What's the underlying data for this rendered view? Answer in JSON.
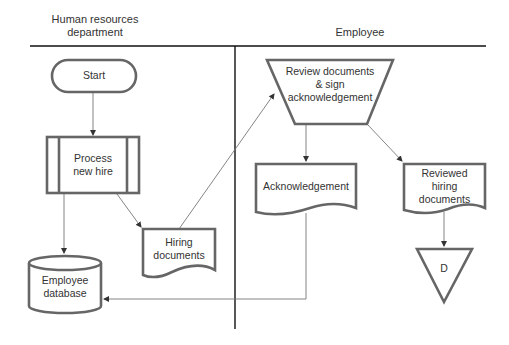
{
  "swimlanes": [
    {
      "id": "hr",
      "title": "Human resources\ndepartment"
    },
    {
      "id": "employee",
      "title": "Employee"
    }
  ],
  "nodes": [
    {
      "id": "start",
      "type": "terminator",
      "lane": "hr",
      "label": "Start"
    },
    {
      "id": "process_new_hire",
      "type": "predefined-process",
      "lane": "hr",
      "label": "Process\nnew hire"
    },
    {
      "id": "hiring_documents",
      "type": "document",
      "lane": "hr",
      "label": "Hiring\ndocuments"
    },
    {
      "id": "employee_database",
      "type": "database",
      "lane": "hr",
      "label": "Employee\ndatabase"
    },
    {
      "id": "review_sign",
      "type": "manual-operation",
      "lane": "employee",
      "label": "Review documents\n& sign\nacknowledgement"
    },
    {
      "id": "acknowledgement",
      "type": "document",
      "lane": "employee",
      "label": "Acknowledgement"
    },
    {
      "id": "reviewed_hiring_documents",
      "type": "document",
      "lane": "employee",
      "label": "Reviewed\nhiring\ndocuments"
    },
    {
      "id": "d",
      "type": "offline-storage",
      "lane": "employee",
      "label": "D"
    }
  ],
  "edges": [
    {
      "from": "start",
      "to": "process_new_hire"
    },
    {
      "from": "process_new_hire",
      "to": "employee_database"
    },
    {
      "from": "process_new_hire",
      "to": "hiring_documents"
    },
    {
      "from": "hiring_documents",
      "to": "review_sign"
    },
    {
      "from": "review_sign",
      "to": "acknowledgement"
    },
    {
      "from": "review_sign",
      "to": "reviewed_hiring_documents"
    },
    {
      "from": "acknowledgement",
      "to": "employee_database"
    },
    {
      "from": "reviewed_hiring_documents",
      "to": "d"
    }
  ],
  "colors": {
    "shape_stroke": "#666666",
    "connector": "#777777",
    "lane_line": "#111111",
    "text": "#333333"
  }
}
